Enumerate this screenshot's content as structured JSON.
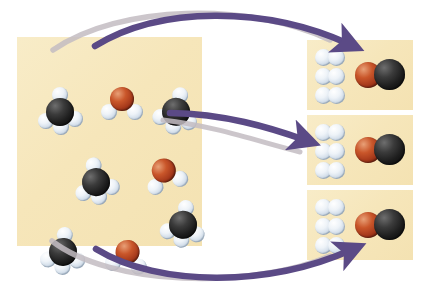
{
  "figure": {
    "background_color": "#ffffff",
    "panel_color": "#f6e6ba"
  },
  "legend": {
    "carbon_color": "#1d1d1d",
    "oxygen_color": "#a3371a",
    "hydrogen_color": "#e6edf5"
  },
  "reactant_panel": {
    "name": "reactants",
    "molecules": [
      {
        "id": "methane-1",
        "formula": "CH4",
        "label": "methane",
        "x": 22,
        "y": 52,
        "rot": 0
      },
      {
        "id": "water-1",
        "formula": "H2O",
        "label": "water",
        "x": 85,
        "y": 47,
        "rot": 0
      },
      {
        "id": "methane-2",
        "formula": "CH4",
        "label": "methane",
        "x": 138,
        "y": 52,
        "rot": 14
      },
      {
        "id": "methane-3",
        "formula": "CH4",
        "label": "methane",
        "x": 58,
        "y": 122,
        "rot": -8
      },
      {
        "id": "water-2",
        "formula": "H2O",
        "label": "water",
        "x": 128,
        "y": 118,
        "rot": -18
      },
      {
        "id": "methane-4",
        "formula": "CH4",
        "label": "methane",
        "x": 145,
        "y": 165,
        "rot": 10
      },
      {
        "id": "methane-5",
        "formula": "CH4",
        "label": "methane",
        "x": 25,
        "y": 192,
        "rot": 6
      },
      {
        "id": "water-3",
        "formula": "H2O",
        "label": "water",
        "x": 90,
        "y": 200,
        "rot": 8
      }
    ],
    "counts": {
      "methane": 5,
      "water": 3
    }
  },
  "product_panels": [
    {
      "id": "product-panel-1",
      "hydrogen_molecules": 3,
      "carbon_monoxide": {
        "formula": "CO",
        "label": "carbon monoxide"
      }
    },
    {
      "id": "product-panel-2",
      "hydrogen_molecules": 3,
      "carbon_monoxide": {
        "formula": "CO",
        "label": "carbon monoxide"
      }
    },
    {
      "id": "product-panel-3",
      "hydrogen_molecules": 3,
      "carbon_monoxide": {
        "formula": "CO",
        "label": "carbon monoxide"
      }
    }
  ],
  "arrows": [
    {
      "id": "arrow-top",
      "color": "#5b4a86",
      "shadow_color": "#b9b2b8",
      "direction": "right"
    },
    {
      "id": "arrow-middle",
      "color": "#5b4a86",
      "shadow_color": "#b9b2b8",
      "direction": "right"
    },
    {
      "id": "arrow-bottom",
      "color": "#5b4a86",
      "shadow_color": "#b9b2b8",
      "direction": "right"
    }
  ],
  "atom_geometry": {
    "methane": {
      "carbon": {
        "cx": 21,
        "cy": 23,
        "r": 14
      },
      "hydrogens": [
        {
          "cx": 21,
          "cy": 6,
          "r": 8
        },
        {
          "cx": 7,
          "cy": 32,
          "r": 8
        },
        {
          "cx": 22,
          "cy": 38,
          "r": 8
        },
        {
          "cx": 36,
          "cy": 30,
          "r": 8
        }
      ]
    },
    "water": {
      "oxygen": {
        "cx": 20,
        "cy": 15,
        "r": 12
      },
      "hydrogens": [
        {
          "cx": 7,
          "cy": 28,
          "r": 8
        },
        {
          "cx": 33,
          "cy": 28,
          "r": 8
        }
      ]
    }
  }
}
